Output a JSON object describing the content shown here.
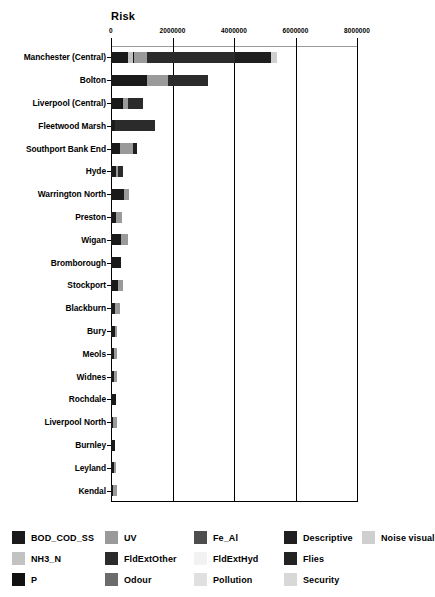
{
  "chart_data": {
    "type": "bar",
    "orientation": "horizontal",
    "stacked": true,
    "title": "Risk",
    "xlabel": "Risk",
    "ylabel": "",
    "xlim": [
      0,
      8000000
    ],
    "xticks": [
      0,
      2000000,
      4000000,
      6000000,
      8000000
    ],
    "xtick_labels": [
      "0",
      "2000000",
      "4000000",
      "6000000",
      "8000000"
    ],
    "grid": true,
    "legend_position": "bottom",
    "categories": [
      "Manchester (Central)",
      "Bolton",
      "Liverpool (Central)",
      "Fleetwood Marsh",
      "Southport Bank End",
      "Hyde",
      "Warrington North",
      "Preston",
      "Wigan",
      "Bromborough",
      "Stockport",
      "Blackburn",
      "Bury",
      "Meols",
      "Widnes",
      "Rochdale",
      "Liverpool North",
      "Burnley",
      "Leyland",
      "Kendal"
    ],
    "series": [
      {
        "name": "BOD_COD_SS",
        "color": "#1a1a1a",
        "values": [
          560000,
          1160000,
          330000,
          140000,
          300000,
          170000,
          420000,
          160000,
          320000,
          330000,
          230000,
          120000,
          120000,
          100000,
          110000,
          150000,
          70000,
          130000,
          90000,
          80000
        ]
      },
      {
        "name": "NH3_N",
        "color": "#c2c2c2",
        "values": [
          160000,
          0,
          0,
          0,
          0,
          0,
          0,
          0,
          0,
          0,
          0,
          0,
          0,
          0,
          0,
          0,
          0,
          0,
          0,
          0
        ]
      },
      {
        "name": "P",
        "color": "#111111",
        "values": [
          40000,
          0,
          60000,
          0,
          0,
          0,
          0,
          0,
          0,
          0,
          0,
          0,
          0,
          0,
          0,
          0,
          0,
          0,
          0,
          0
        ]
      },
      {
        "name": "UV",
        "color": "#9a9a9a",
        "values": [
          400000,
          700000,
          170000,
          0,
          430000,
          60000,
          150000,
          190000,
          240000,
          0,
          150000,
          170000,
          80000,
          90000,
          80000,
          0,
          130000,
          0,
          60000,
          100000
        ]
      },
      {
        "name": "FldExtOther",
        "color": "#2b2b2b",
        "values": [
          2880000,
          1300000,
          470000,
          1290000,
          0,
          150000,
          0,
          0,
          0,
          0,
          0,
          0,
          0,
          0,
          0,
          0,
          0,
          0,
          0,
          0
        ]
      },
      {
        "name": "Odour",
        "color": "#6b6b6b",
        "values": [
          0,
          0,
          0,
          0,
          0,
          0,
          0,
          0,
          0,
          0,
          0,
          0,
          0,
          0,
          0,
          0,
          0,
          0,
          0,
          0
        ]
      },
      {
        "name": "Fe_Al",
        "color": "#4d4d4d",
        "values": [
          0,
          0,
          0,
          0,
          0,
          0,
          0,
          0,
          0,
          0,
          0,
          0,
          0,
          0,
          0,
          0,
          0,
          0,
          0,
          0
        ]
      },
      {
        "name": "FldExtHyd",
        "color": "#f2f2f2",
        "values": [
          0,
          0,
          0,
          0,
          0,
          0,
          0,
          0,
          0,
          0,
          0,
          0,
          0,
          0,
          0,
          0,
          0,
          0,
          0,
          0
        ]
      },
      {
        "name": "Pollution",
        "color": "#e0e0e0",
        "values": [
          0,
          0,
          0,
          0,
          0,
          0,
          0,
          0,
          0,
          0,
          0,
          0,
          0,
          0,
          0,
          0,
          0,
          0,
          0,
          0
        ]
      },
      {
        "name": "Descriptive",
        "color": "#1f1f1f",
        "values": [
          1180000,
          0,
          0,
          0,
          110000,
          0,
          0,
          0,
          0,
          0,
          0,
          0,
          0,
          0,
          0,
          0,
          0,
          0,
          0,
          0
        ]
      },
      {
        "name": "Flies",
        "color": "#232323",
        "values": [
          0,
          0,
          0,
          0,
          0,
          0,
          0,
          0,
          0,
          0,
          0,
          0,
          0,
          0,
          0,
          0,
          0,
          0,
          0,
          0
        ]
      },
      {
        "name": "Security",
        "color": "#d8d8d8",
        "values": [
          0,
          0,
          0,
          0,
          0,
          0,
          0,
          0,
          0,
          0,
          0,
          0,
          0,
          0,
          0,
          0,
          0,
          0,
          0,
          0
        ]
      },
      {
        "name": "Noise visual",
        "color": "#cfcfcf",
        "values": [
          190000,
          0,
          0,
          0,
          0,
          0,
          0,
          0,
          0,
          0,
          0,
          0,
          0,
          0,
          0,
          0,
          0,
          0,
          0,
          0
        ]
      }
    ],
    "totals": [
      5410000,
      3160000,
      1030000,
      1430000,
      840000,
      380000,
      570000,
      350000,
      560000,
      330000,
      380000,
      290000,
      200000,
      190000,
      190000,
      150000,
      200000,
      130000,
      150000,
      180000
    ]
  },
  "axis": {
    "title": "Risk",
    "ticks": [
      {
        "label": "0",
        "value": 0
      },
      {
        "label": "2000000",
        "value": 2000000
      },
      {
        "label": "4000000",
        "value": 4000000
      },
      {
        "label": "6000000",
        "value": 6000000
      },
      {
        "label": "8000000",
        "value": 8000000
      }
    ]
  },
  "legend": {
    "rows": [
      [
        {
          "label": "BOD_COD_SS",
          "color": "#1a1a1a"
        },
        {
          "label": "UV",
          "color": "#9a9a9a"
        },
        {
          "label": "Fe_Al",
          "color": "#4d4d4d"
        },
        {
          "label": "Descriptive",
          "color": "#1f1f1f"
        },
        {
          "label": "Noise visual",
          "color": "#cfcfcf"
        }
      ],
      [
        {
          "label": "NH3_N",
          "color": "#c2c2c2"
        },
        {
          "label": "FldExtOther",
          "color": "#2b2b2b"
        },
        {
          "label": "FldExtHyd",
          "color": "#f2f2f2"
        },
        {
          "label": "Flies",
          "color": "#232323"
        }
      ],
      [
        {
          "label": "P",
          "color": "#111111"
        },
        {
          "label": "Odour",
          "color": "#6b6b6b"
        },
        {
          "label": "Pollution",
          "color": "#e0e0e0"
        },
        {
          "label": "Security",
          "color": "#d8d8d8"
        }
      ]
    ]
  }
}
